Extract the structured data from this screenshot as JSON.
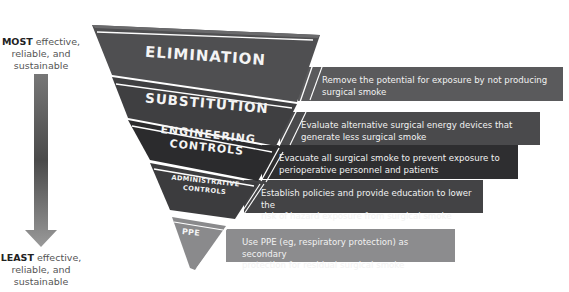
{
  "diagram": {
    "type": "hierarchy-of-controls-funnel",
    "top_label": {
      "bold": "MOST",
      "rest_line1": " effective,",
      "line2": "reliable, and",
      "line3": "sustainable"
    },
    "bottom_label": {
      "bold": "LEAST",
      "rest_line1": " effective,",
      "line2": "reliable, and",
      "line3": "sustainable"
    },
    "tiers": [
      {
        "label": "ELIMINATION",
        "description_line1": "Remove the potential for exposure by not producing",
        "description_line2": "surgical smoke",
        "color": "#5a5a5c"
      },
      {
        "label": "SUBSTITUTION",
        "description_line1": "Evaluate alternative surgical energy devices that",
        "description_line2": "generate less surgical smoke",
        "color": "#4a4a4c"
      },
      {
        "label_line1": "ENGINEERING",
        "label_line2": "CONTROLS",
        "description_line1": "Evacuate all surgical smoke to prevent exposure to",
        "description_line2": "perioperative personnel and patients",
        "color": "#2e2e30"
      },
      {
        "label_line1": "ADMINISTRATIVE",
        "label_line2": "CONTROLS",
        "description_line1": "Establish policies and provide education to lower the",
        "description_line2": "risk of hazard exposure from surgical smoke",
        "color": "#434345"
      },
      {
        "label": "PPE",
        "description_line1": "Use PPE (eg, respiratory protection) as secondary",
        "description_line2": "protection for residual surgical smoke",
        "color": "#8c8c8e"
      }
    ],
    "arrow_color_top": "#7a7a7a",
    "arrow_color_bottom": "#9a9a9a"
  }
}
